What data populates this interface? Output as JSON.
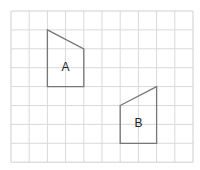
{
  "grid": {
    "origin_x": 11,
    "origin_y": 11,
    "cols": 10,
    "rows": 8,
    "cell_w": 18.2,
    "cell_h": 18.9,
    "line_color": "#d9d9d9",
    "border_color": "#cfcfcf"
  },
  "shapes": [
    {
      "label": "A",
      "points": [
        [
          2,
          1
        ],
        [
          4,
          2
        ],
        [
          4,
          4
        ],
        [
          2,
          4
        ]
      ],
      "label_pos": [
        3,
        2.95
      ],
      "stroke": "#777777"
    },
    {
      "label": "B",
      "points": [
        [
          6,
          5
        ],
        [
          8,
          4
        ],
        [
          8,
          7
        ],
        [
          6,
          7
        ]
      ],
      "label_pos": [
        7,
        5.95
      ],
      "stroke": "#777777"
    }
  ]
}
